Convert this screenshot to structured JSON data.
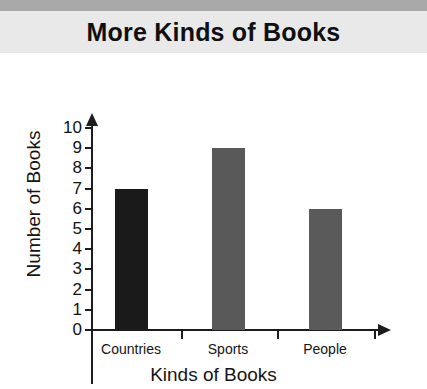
{
  "banner": {
    "title": "More Kinds of Books",
    "strip_color": "#a9a9a9",
    "background_color": "#e9e9e9"
  },
  "chart_data": {
    "type": "bar",
    "title": "More Kinds of Books",
    "xlabel": "Kinds of Books",
    "ylabel": "Number of Books",
    "categories": [
      "Countries",
      "Sports",
      "People"
    ],
    "values": [
      7,
      9,
      6
    ],
    "series": [
      {
        "name": "Number of Books",
        "values": [
          7,
          9,
          6
        ]
      }
    ],
    "bar_colors": [
      "#1a1a1a",
      "#595959",
      "#5a5a5a"
    ],
    "ylim": [
      0,
      10
    ],
    "ytick_labels": [
      "10",
      "9",
      "8",
      "7",
      "6",
      "5",
      "4",
      "3",
      "2",
      "1",
      "0"
    ],
    "ytick_values": [
      10,
      9,
      8,
      7,
      6,
      5,
      4,
      3,
      2,
      1,
      0
    ],
    "grid": false,
    "legend": "none",
    "axis_color": "#1c1c1c",
    "axis_arrows": true
  }
}
